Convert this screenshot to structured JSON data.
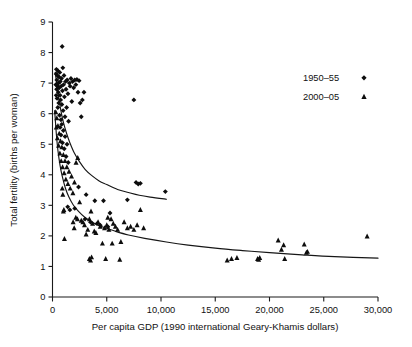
{
  "chart_data": {
    "type": "scatter",
    "title": "",
    "xlabel": "Per capita GDP (1990 international Geary-Khamis dollars)",
    "ylabel": "Total fertility (births per woman)",
    "xlim": [
      0,
      30000
    ],
    "ylim": [
      0,
      9
    ],
    "xticks": [
      0,
      5000,
      10000,
      15000,
      20000,
      25000,
      30000
    ],
    "xtick_labels": [
      "0",
      "5,000",
      "10,000",
      "15,000",
      "20,000",
      "25,000",
      "30,000"
    ],
    "yticks": [
      0,
      1,
      2,
      3,
      4,
      5,
      6,
      7,
      8,
      9
    ],
    "ytick_labels": [
      "0",
      "1",
      "2",
      "3",
      "4",
      "5",
      "6",
      "7",
      "8",
      "9"
    ],
    "grid": false,
    "legend_position": "top-right",
    "marker_color": "#0d0d0d",
    "line_color": "#161616",
    "series": [
      {
        "name": "1950–55",
        "marker": "diamond",
        "points": [
          [
            300,
            6.95
          ],
          [
            330,
            7.3
          ],
          [
            340,
            6.6
          ],
          [
            360,
            7.45
          ],
          [
            380,
            6.8
          ],
          [
            400,
            7.1
          ],
          [
            420,
            6.5
          ],
          [
            450,
            7.25
          ],
          [
            470,
            6.9
          ],
          [
            490,
            6.2
          ],
          [
            510,
            7.4
          ],
          [
            530,
            6.7
          ],
          [
            560,
            7.0
          ],
          [
            580,
            6.35
          ],
          [
            600,
            7.2
          ],
          [
            620,
            6.85
          ],
          [
            650,
            5.95
          ],
          [
            670,
            7.35
          ],
          [
            700,
            6.6
          ],
          [
            720,
            7.05
          ],
          [
            750,
            6.45
          ],
          [
            780,
            5.8
          ],
          [
            800,
            6.9
          ],
          [
            830,
            7.15
          ],
          [
            860,
            6.3
          ],
          [
            890,
            8.2
          ],
          [
            920,
            6.75
          ],
          [
            950,
            7.5
          ],
          [
            980,
            6.1
          ],
          [
            1020,
            6.95
          ],
          [
            1060,
            7.25
          ],
          [
            1100,
            6.55
          ],
          [
            1150,
            5.9
          ],
          [
            1200,
            7.05
          ],
          [
            1250,
            6.8
          ],
          [
            1300,
            6.2
          ],
          [
            1350,
            7.1
          ],
          [
            1420,
            6.65
          ],
          [
            1480,
            5.75
          ],
          [
            1550,
            7.0
          ],
          [
            1620,
            6.9
          ],
          [
            1700,
            7.15
          ],
          [
            1780,
            6.4
          ],
          [
            1850,
            7.05
          ],
          [
            1950,
            6.85
          ],
          [
            2050,
            7.1
          ],
          [
            2150,
            6.95
          ],
          [
            2250,
            7.12
          ],
          [
            2350,
            6.7
          ],
          [
            2450,
            7.08
          ],
          [
            2550,
            6.35
          ],
          [
            2650,
            5.9
          ],
          [
            2750,
            6.45
          ],
          [
            2900,
            6.7
          ],
          [
            700,
            5.55
          ],
          [
            780,
            5.3
          ],
          [
            850,
            5.65
          ],
          [
            920,
            5.05
          ],
          [
            1000,
            5.45
          ],
          [
            1080,
            4.85
          ],
          [
            1160,
            5.25
          ],
          [
            1250,
            4.6
          ],
          [
            1340,
            5.0
          ],
          [
            1450,
            4.4
          ],
          [
            2400,
            3.6
          ],
          [
            3100,
            3.35
          ],
          [
            3900,
            3.15
          ],
          [
            4700,
            3.15
          ],
          [
            5300,
            2.75
          ],
          [
            6900,
            3.18
          ],
          [
            7500,
            6.45
          ],
          [
            7700,
            3.75
          ],
          [
            7900,
            3.7
          ],
          [
            8100,
            3.72
          ],
          [
            10400,
            3.45
          ],
          [
            1400,
            2.95
          ],
          [
            1600,
            2.85
          ],
          [
            2050,
            2.9
          ],
          [
            3000,
            2.55
          ],
          [
            3500,
            2.45
          ],
          [
            4100,
            2.4
          ],
          [
            4400,
            2.35
          ],
          [
            5100,
            2.3
          ]
        ]
      },
      {
        "name": "2000–05",
        "marker": "triangle",
        "points": [
          [
            300,
            6.05
          ],
          [
            350,
            5.55
          ],
          [
            400,
            5.85
          ],
          [
            450,
            5.2
          ],
          [
            500,
            5.6
          ],
          [
            560,
            4.95
          ],
          [
            620,
            5.35
          ],
          [
            680,
            4.7
          ],
          [
            740,
            5.1
          ],
          [
            800,
            4.45
          ],
          [
            860,
            4.9
          ],
          [
            930,
            4.25
          ],
          [
            1000,
            4.65
          ],
          [
            1070,
            4.05
          ],
          [
            1150,
            4.45
          ],
          [
            1230,
            3.85
          ],
          [
            1320,
            4.25
          ],
          [
            1420,
            3.7
          ],
          [
            1520,
            4.1
          ],
          [
            1630,
            3.55
          ],
          [
            1750,
            3.95
          ],
          [
            1880,
            3.4
          ],
          [
            2020,
            3.75
          ],
          [
            2170,
            4.4
          ],
          [
            2330,
            4.55
          ],
          [
            900,
            3.55
          ],
          [
            950,
            3.35
          ],
          [
            1000,
            2.8
          ],
          [
            1050,
            2.85
          ],
          [
            1100,
            1.9
          ],
          [
            1900,
            2.45
          ],
          [
            2000,
            2.25
          ],
          [
            2150,
            2.6
          ],
          [
            2300,
            2.55
          ],
          [
            2500,
            3.1
          ],
          [
            2650,
            2.5
          ],
          [
            2800,
            2.45
          ],
          [
            2950,
            2.35
          ],
          [
            3100,
            2.05
          ],
          [
            3250,
            2.2
          ],
          [
            3400,
            2.55
          ],
          [
            3550,
            2.8
          ],
          [
            3700,
            2.4
          ],
          [
            3850,
            2.15
          ],
          [
            4000,
            2.1
          ],
          [
            4200,
            2.45
          ],
          [
            4400,
            2.3
          ],
          [
            4600,
            1.75
          ],
          [
            4800,
            2.25
          ],
          [
            5000,
            2.35
          ],
          [
            5200,
            2.2
          ],
          [
            5400,
            2.55
          ],
          [
            5600,
            2.4
          ],
          [
            5800,
            2.3
          ],
          [
            6000,
            2.2
          ],
          [
            6300,
            1.8
          ],
          [
            6600,
            2.45
          ],
          [
            6900,
            2.25
          ],
          [
            7200,
            2.3
          ],
          [
            7500,
            2.2
          ],
          [
            7800,
            2.35
          ],
          [
            8100,
            2.85
          ],
          [
            8400,
            2.25
          ],
          [
            5100,
            2.6
          ],
          [
            5500,
            1.75
          ],
          [
            3400,
            1.25
          ],
          [
            3500,
            1.2
          ],
          [
            3600,
            1.3
          ],
          [
            4900,
            1.25
          ],
          [
            6200,
            1.22
          ],
          [
            16100,
            1.2
          ],
          [
            16500,
            1.25
          ],
          [
            17000,
            1.28
          ],
          [
            18900,
            1.25
          ],
          [
            19100,
            1.28
          ],
          [
            19000,
            1.22
          ],
          [
            20800,
            1.85
          ],
          [
            21100,
            1.55
          ],
          [
            21300,
            1.7
          ],
          [
            21400,
            1.25
          ],
          [
            23200,
            1.72
          ],
          [
            23400,
            1.45
          ],
          [
            23500,
            1.48
          ],
          [
            29000,
            1.98
          ]
        ]
      }
    ],
    "fit_curves": [
      {
        "name": "1950–55 trend",
        "x_start": 250,
        "x_end": 10500,
        "points": [
          [
            250,
            7.35
          ],
          [
            400,
            6.95
          ],
          [
            600,
            6.45
          ],
          [
            800,
            6.05
          ],
          [
            1000,
            5.72
          ],
          [
            1300,
            5.35
          ],
          [
            1600,
            5.05
          ],
          [
            2000,
            4.72
          ],
          [
            2500,
            4.42
          ],
          [
            3000,
            4.18
          ],
          [
            3600,
            3.98
          ],
          [
            4300,
            3.8
          ],
          [
            5000,
            3.68
          ],
          [
            6000,
            3.52
          ],
          [
            7000,
            3.42
          ],
          [
            8000,
            3.33
          ],
          [
            9000,
            3.27
          ],
          [
            10500,
            3.2
          ]
        ]
      },
      {
        "name": "2000–05 trend",
        "x_start": 200,
        "x_end": 30000,
        "points": [
          [
            200,
            6.1
          ],
          [
            350,
            5.35
          ],
          [
            500,
            4.8
          ],
          [
            700,
            4.3
          ],
          [
            900,
            3.95
          ],
          [
            1200,
            3.55
          ],
          [
            1500,
            3.28
          ],
          [
            1900,
            3.02
          ],
          [
            2400,
            2.8
          ],
          [
            3000,
            2.6
          ],
          [
            3800,
            2.42
          ],
          [
            4700,
            2.28
          ],
          [
            5800,
            2.15
          ],
          [
            7000,
            2.03
          ],
          [
            8500,
            1.92
          ],
          [
            10500,
            1.8
          ],
          [
            12500,
            1.7
          ],
          [
            15000,
            1.6
          ],
          [
            17500,
            1.52
          ],
          [
            20000,
            1.45
          ],
          [
            23000,
            1.38
          ],
          [
            26000,
            1.32
          ],
          [
            30000,
            1.27
          ]
        ]
      }
    ]
  },
  "legend": {
    "entries": [
      {
        "label": "1950–55",
        "marker": "diamond"
      },
      {
        "label": "2000–05",
        "marker": "triangle"
      }
    ]
  }
}
